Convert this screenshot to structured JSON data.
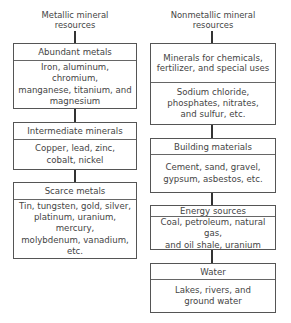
{
  "left_column": {
    "title_lines": [
      "Metallic mineral",
      "resources"
    ],
    "boxes": [
      {
        "header": "Abundant metals",
        "body_lines": [
          "Iron, aluminum, chromium,",
          "manganese, titanium, and",
          "magnesium"
        ]
      },
      {
        "header": "Intermediate minerals",
        "body_lines": [
          "Copper, lead, zinc,",
          "cobalt, nickel"
        ]
      },
      {
        "header": "Scarce metals",
        "body_lines": [
          "Tin, tungsten, gold, silver,",
          "platinum, uranium, mercury,",
          "molybdenum, vanadium,",
          "etc."
        ]
      }
    ]
  },
  "right_column": {
    "title_lines": [
      "Nonmetallic mineral",
      "resources"
    ],
    "boxes": [
      {
        "header_lines": [
          "Minerals for chemicals,",
          "fertilizer, and special uses"
        ],
        "body_lines": [
          "Sodium chloride,",
          "phosphates, nitrates,",
          "and sulfur, etc."
        ]
      },
      {
        "header": "Building materials",
        "body_lines": [
          "Cement, sand, gravel,",
          "gypsum, asbestos, etc."
        ]
      },
      {
        "header": "Energy sources",
        "body_lines": [
          "Coal, petroleum, natural gas,",
          "and oil shale, uranium"
        ]
      },
      {
        "header": "Water",
        "body_lines": [
          "Lakes, rivers, and",
          "ground water"
        ]
      }
    ]
  }
}
